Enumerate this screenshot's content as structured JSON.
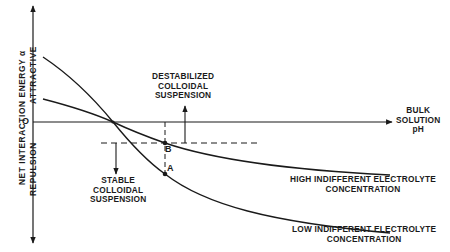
{
  "diagram": {
    "y_axis": {
      "title": "NET INTERACTION ENERGY α",
      "upper_label": "ATTRACTIVE",
      "lower_label": "REPULSION",
      "zero_label": "O"
    },
    "x_axis": {
      "label_lines": [
        "BULK",
        "SOLUTION",
        "pH"
      ]
    },
    "regions": {
      "destabilized": [
        "DESTABILIZED",
        "COLLOIDAL",
        "SUSPENSION"
      ],
      "stable": [
        "STABLE",
        "COLLOIDAL",
        "SUSPENSION"
      ]
    },
    "points": {
      "a": "A",
      "b": "B"
    },
    "curves": {
      "high": [
        "HIGH INDIFFERENT ELECTROLYTE",
        "CONCENTRATION"
      ],
      "low": [
        "LOW INDIFFERENT ELECTROLYTE",
        "CONCENTRATION"
      ]
    },
    "colors": {
      "ink": "#1a1a1a",
      "background": "#ffffff"
    }
  }
}
